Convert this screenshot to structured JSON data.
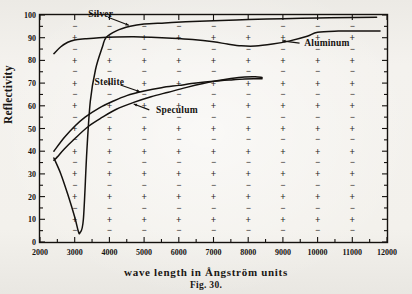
{
  "figure": {
    "caption": "Fig. 30.",
    "title": "",
    "background_color": "#f2f0ec",
    "ink_color": "#14110e"
  },
  "axes": {
    "y_axis_title": "Reflectivity",
    "x_axis_title": "wave length in Ångström units",
    "y_ticks": [
      "0",
      "10",
      "20",
      "30",
      "40",
      "50",
      "60",
      "70",
      "80",
      "90",
      "100"
    ],
    "x_ticks": [
      "2000",
      "3000",
      "4000",
      "5000",
      "6000",
      "7000",
      "8000",
      "9000",
      "10000",
      "11000",
      "12000"
    ]
  },
  "grid": {
    "major_mark_glyph": "+",
    "minor_mark_glyph": "−"
  },
  "series_labels": {
    "silver": "Silver",
    "aluminum": "Aluminum",
    "stellite": "Stellite",
    "speculum": "Speculum"
  },
  "chart_data": {
    "type": "line",
    "title": "Fig. 30.",
    "xlabel": "wave length in Ångström units",
    "ylabel": "Reflectivity",
    "xlim": [
      2000,
      12000
    ],
    "ylim": [
      0,
      100
    ],
    "xticks": [
      2000,
      3000,
      4000,
      5000,
      6000,
      7000,
      8000,
      9000,
      10000,
      11000,
      12000
    ],
    "yticks": [
      0,
      10,
      20,
      30,
      40,
      50,
      60,
      70,
      80,
      90,
      100
    ],
    "grid": "plus-and-dash marker grid",
    "legend": "inline curve labels with leader arrows",
    "series": [
      {
        "name": "Silver",
        "label_position": {
          "x": 3750,
          "y": 99
        },
        "x": [
          2400,
          2600,
          2800,
          3000,
          3100,
          3150,
          3250,
          3350,
          3450,
          3600,
          3800,
          3900,
          4200,
          4600,
          5000,
          5600,
          6200,
          7000,
          8000,
          9000,
          10000,
          11000,
          11700
        ],
        "y": [
          37,
          30,
          21,
          11,
          5,
          4,
          10,
          40,
          62,
          76,
          86,
          90,
          93,
          95,
          96,
          96.5,
          97,
          97.5,
          98,
          98.4,
          98.7,
          98.9,
          99
        ]
      },
      {
        "name": "Aluminum",
        "label_position": {
          "x": 9500,
          "y": 88
        },
        "x": [
          2400,
          2600,
          2800,
          3000,
          3300,
          3700,
          4200,
          4700,
          5200,
          5800,
          6400,
          7000,
          7400,
          7800,
          8200,
          8700,
          9200,
          9700,
          10000,
          10600,
          11300,
          11800
        ],
        "y": [
          83,
          86,
          88,
          89,
          89.5,
          90,
          90.3,
          90.4,
          90.2,
          89.8,
          89.2,
          88.2,
          87.2,
          86.4,
          86.3,
          87.2,
          88.6,
          90.6,
          92.4,
          92.9,
          93,
          93
        ]
      },
      {
        "name": "Stellite",
        "label_position": {
          "x": 4000,
          "y": 69
        },
        "x": [
          2400,
          2700,
          3000,
          3300,
          3700,
          4100,
          4500,
          5000,
          5500,
          6000,
          6500,
          7000,
          7500,
          7900,
          8200,
          8400
        ],
        "y": [
          40,
          46,
          51,
          55,
          59,
          62,
          64.5,
          66.5,
          68,
          69,
          70,
          70.8,
          71.4,
          71.8,
          71.9,
          71.9
        ]
      },
      {
        "name": "Speculum",
        "label_position": {
          "x": 5200,
          "y": 58
        },
        "x": [
          2400,
          2500,
          2700,
          3000,
          3400,
          3800,
          4200,
          4700,
          5200,
          5700,
          6200,
          6700,
          7100,
          7500,
          7900,
          8200,
          8400
        ],
        "y": [
          36,
          37.5,
          41,
          45.5,
          51,
          55,
          58.5,
          61.5,
          64,
          66,
          68,
          69.8,
          71,
          72,
          72.7,
          72.8,
          72.5
        ]
      }
    ]
  }
}
